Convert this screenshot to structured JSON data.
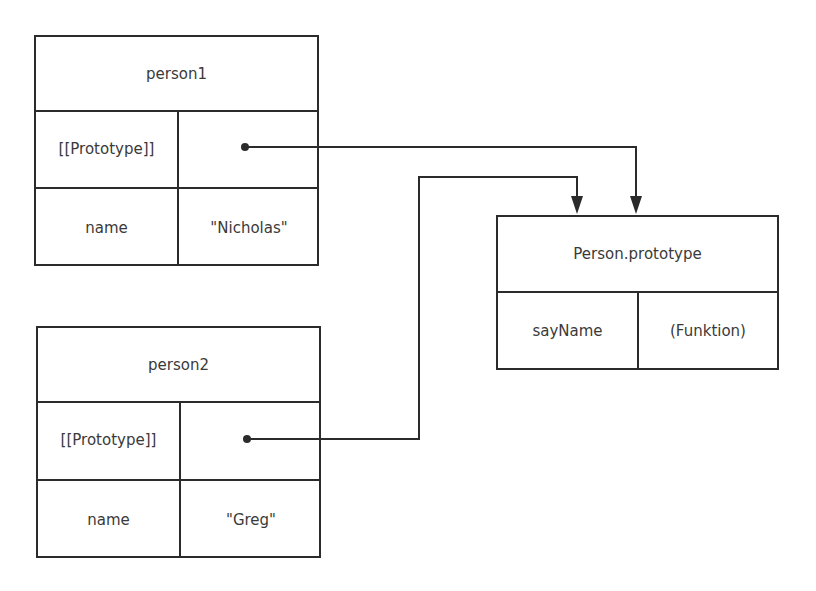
{
  "diagram": {
    "objects": [
      {
        "id": "person1",
        "title": "person1",
        "rows": [
          {
            "key": "[[Prototype]]",
            "value": ""
          },
          {
            "key": "name",
            "value": "\"Nicholas\""
          }
        ]
      },
      {
        "id": "person2",
        "title": "person2",
        "rows": [
          {
            "key": "[[Prototype]]",
            "value": ""
          },
          {
            "key": "name",
            "value": "\"Greg\""
          }
        ]
      },
      {
        "id": "person_prototype",
        "title": "Person.prototype",
        "rows": [
          {
            "key": "sayName",
            "value": "(Funktion)"
          }
        ]
      }
    ],
    "links": [
      {
        "from": "person1.[[Prototype]]",
        "to": "Person.prototype"
      },
      {
        "from": "person2.[[Prototype]]",
        "to": "Person.prototype"
      }
    ],
    "colors": {
      "stroke": "#2b2b2b",
      "text": "#3a3a3a",
      "background": "#ffffff"
    }
  }
}
